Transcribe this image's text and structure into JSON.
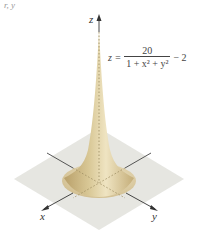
{
  "figure": {
    "top_crop_text": "r, y",
    "axes": {
      "x_label": "x",
      "y_label": "y",
      "z_label": "z"
    },
    "equation": {
      "lhs": "z =",
      "numerator": "20",
      "denominator": "1 + x² + y²",
      "tail": "− 2"
    },
    "colors": {
      "surface_light": "#ece0b8",
      "surface_dark": "#b9a06a",
      "plane": "#e4e4df",
      "axis": "#333333",
      "dotted": "#9a8a60"
    }
  }
}
